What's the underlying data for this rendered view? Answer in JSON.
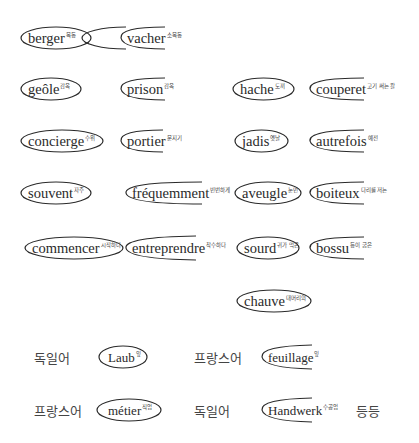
{
  "diagram": {
    "pairs": [
      {
        "closed": {
          "word": "berger",
          "gloss": "목동"
        },
        "open": {
          "word": "vacher",
          "gloss": "소목동"
        }
      },
      {
        "closed": {
          "word": "geôle",
          "gloss": "감옥"
        },
        "open": {
          "word": "prison",
          "gloss": "감옥"
        }
      },
      {
        "closed": {
          "word": "hache",
          "gloss": "도끼"
        },
        "open": {
          "word": "couperet",
          "gloss": "고기 써는 칼"
        }
      },
      {
        "closed": {
          "word": "concierge",
          "gloss": "수위"
        },
        "open": {
          "word": "portier",
          "gloss": "문지기"
        }
      },
      {
        "closed": {
          "word": "jadis",
          "gloss": "옛날"
        },
        "open": {
          "word": "autrefois",
          "gloss": "예전"
        }
      },
      {
        "closed": {
          "word": "souvent",
          "gloss": "자주"
        },
        "open": {
          "word": "fréquemment",
          "gloss": "빈번하게"
        }
      },
      {
        "closed": {
          "word": "aveugle",
          "gloss": "눈먼"
        },
        "open": {
          "word": "boiteux",
          "gloss": "다리를 저는"
        }
      },
      {
        "closed": {
          "word": "commencer",
          "gloss": "시작하다"
        },
        "open": {
          "word": "entreprendre",
          "gloss": "착수하다"
        }
      },
      {
        "closed": {
          "word": "sourd",
          "gloss": "귀가 먹은"
        },
        "open": {
          "word": "bossu",
          "gloss": "등이 굽은"
        }
      },
      {
        "closed": {
          "word": "chauve",
          "gloss": "대머리의"
        }
      }
    ],
    "legend": {
      "row1": {
        "lang1": "독일어",
        "word1": {
          "word": "Laub",
          "gloss": "잎"
        },
        "lang2": "프랑스어",
        "word2": {
          "word": "feuillage",
          "gloss": "잎"
        }
      },
      "row2": {
        "lang1": "프랑스어",
        "word1": {
          "word": "métier",
          "gloss": "직업"
        },
        "lang2": "독일어",
        "word2": {
          "word": "Handwerk",
          "gloss": "수공업"
        },
        "etc": "등등"
      }
    },
    "stroke_color": "#2a2a2a"
  }
}
